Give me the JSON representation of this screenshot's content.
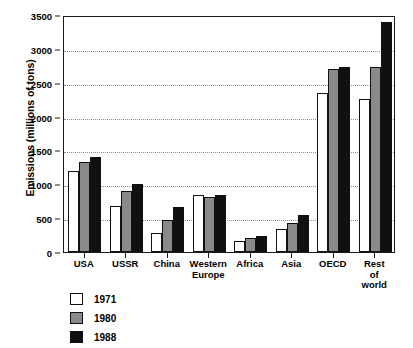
{
  "chart_data": {
    "type": "bar",
    "title": "",
    "xlabel": "",
    "ylabel": "Emissions (millions of tons)",
    "ylim": [
      0,
      3500
    ],
    "yticks": [
      0,
      500,
      1000,
      1500,
      2000,
      2500,
      3000,
      3500
    ],
    "grid": true,
    "legend_position": "below-left",
    "categories": [
      "USA",
      "USSR",
      "China",
      "Western\nEurope",
      "Africa",
      "Asia",
      "OECD",
      "Rest of\nworld"
    ],
    "series": [
      {
        "name": "1971",
        "color": "#ffffff",
        "values": [
          1190,
          680,
          275,
          840,
          170,
          340,
          2350,
          2260
        ]
      },
      {
        "name": "1980",
        "color": "#8a8a8a",
        "values": [
          1330,
          900,
          470,
          810,
          205,
          430,
          2700,
          2730
        ]
      },
      {
        "name": "1988",
        "color": "#101010",
        "values": [
          1410,
          1000,
          660,
          840,
          240,
          540,
          2730,
          3400
        ]
      }
    ]
  }
}
